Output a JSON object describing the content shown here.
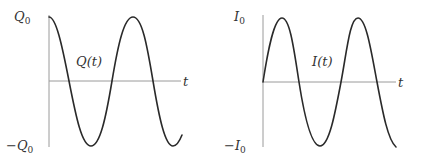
{
  "left_plot": {
    "variable": "Q",
    "y_top_label": "Q",
    "y_top_sub": "0",
    "y_bottom_prefix": "−",
    "y_bottom_label": "Q",
    "y_bottom_sub": "0",
    "curve_label": "Q(t)",
    "x_axis_label": "t",
    "function": "cosine"
  },
  "right_plot": {
    "variable": "I",
    "y_top_label": "I",
    "y_top_sub": "0",
    "y_bottom_prefix": "−",
    "y_bottom_label": "I",
    "y_bottom_sub": "0",
    "curve_label": "I(t)",
    "x_axis_label": "t",
    "function": "sine"
  },
  "colors": {
    "axis": "#9a9a9a",
    "curve": "#2a2a2a",
    "text": "#333333"
  }
}
